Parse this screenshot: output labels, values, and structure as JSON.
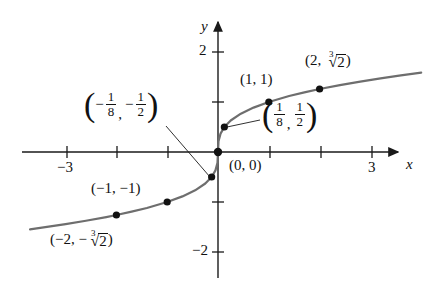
{
  "figure": {
    "title_visible": false,
    "background_color": "#ffffff",
    "curve_color": "#6e6e6e",
    "axis_color": "#1a1a1a",
    "point_color": "#111111"
  },
  "axes": {
    "x_axis_label": "x",
    "y_axis_label": "y",
    "x_ticks": [
      {
        "value": -3,
        "label": "−3",
        "show_label": true
      },
      {
        "value": -2,
        "label": "",
        "show_label": false
      },
      {
        "value": -1,
        "label": "",
        "show_label": false
      },
      {
        "value": 1,
        "label": "",
        "show_label": false
      },
      {
        "value": 2,
        "label": "",
        "show_label": false
      },
      {
        "value": 3,
        "label": "3",
        "show_label": true
      }
    ],
    "y_ticks": [
      {
        "value": 2,
        "label": "2",
        "show_label": true
      },
      {
        "value": 1,
        "label": "",
        "show_label": false
      },
      {
        "value": -1,
        "label": "",
        "show_label": false
      },
      {
        "value": -2,
        "label": "−2",
        "show_label": true
      }
    ],
    "xlim": [
      -3.9,
      4.15
    ],
    "ylim": [
      -2.55,
      2.35
    ],
    "grid": false
  },
  "chart_data": {
    "type": "line",
    "title": "",
    "xlabel": "x",
    "ylabel": "y",
    "xlim": [
      -3.9,
      4.15
    ],
    "ylim": [
      -2.55,
      2.35
    ],
    "grid": false,
    "legend": "none",
    "function": "y = cube root of x",
    "series": [
      {
        "name": "y = ∛x",
        "color": "#6e6e6e",
        "x": [
          -3.7,
          -3.4,
          -3.0,
          -2.6,
          -2.2,
          -2.0,
          -1.7,
          -1.4,
          -1.0,
          -0.7,
          -0.45,
          -0.25,
          -0.125,
          -0.05,
          -0.01,
          0,
          0.01,
          0.05,
          0.125,
          0.25,
          0.45,
          0.7,
          1.0,
          1.4,
          1.7,
          2.0,
          2.4,
          2.8,
          3.2,
          3.6,
          4.0
        ],
        "y": [
          -1.547,
          -1.504,
          -1.442,
          -1.375,
          -1.301,
          -1.26,
          -1.193,
          -1.119,
          -1.0,
          -0.888,
          -0.766,
          -0.63,
          -0.5,
          -0.368,
          -0.215,
          0,
          0.215,
          0.368,
          0.5,
          0.63,
          0.766,
          0.888,
          1.0,
          1.119,
          1.193,
          1.26,
          1.339,
          1.409,
          1.474,
          1.533,
          1.587
        ]
      }
    ],
    "points": [
      {
        "id": "p-neg2",
        "x": -2,
        "y": -1.26,
        "label_text": "(−2, −∛2)"
      },
      {
        "id": "p-neg1",
        "x": -1,
        "y": -1,
        "label_text": "(−1, −1)"
      },
      {
        "id": "p-neg-eighth",
        "x": -0.125,
        "y": -0.5,
        "label_text": "(−1/8, −1/2)"
      },
      {
        "id": "p-origin",
        "x": 0,
        "y": 0,
        "label_text": "(0, 0)"
      },
      {
        "id": "p-pos-eighth",
        "x": 0.125,
        "y": 0.5,
        "label_text": "(1/8, 1/2)"
      },
      {
        "id": "p-pos1",
        "x": 1,
        "y": 1,
        "label_text": "(1, 1)"
      },
      {
        "id": "p-pos2",
        "x": 2,
        "y": 1.26,
        "label_text": "(2, ∛2)"
      }
    ]
  },
  "labels": {
    "origin": "(0, 0)",
    "point_1_1": "(1, 1)",
    "point_neg1_neg1": "(−1, −1)",
    "point_2_cbrt2": {
      "open_paren": "(",
      "x_part": "2,",
      "radical_index": "3",
      "radical_glyph": "√",
      "radicand": "2",
      "close_paren": ")"
    },
    "point_neg2_neg_cbrt2": {
      "open_paren": "(",
      "x_part": "−2,",
      "minus": "−",
      "radical_index": "3",
      "radical_glyph": "√",
      "radicand": "2",
      "close_paren": ")"
    },
    "point_eighth_half": {
      "open_paren": "(",
      "x_num": "1",
      "x_den": "8",
      "comma": ",",
      "y_num": "1",
      "y_den": "2",
      "close_paren": ")"
    },
    "point_neg_eighth_neg_half": {
      "open_paren": "(",
      "x_sign": "−",
      "x_num": "1",
      "x_den": "8",
      "comma": ",",
      "y_sign": "−",
      "y_num": "1",
      "y_den": "2",
      "close_paren": ")"
    }
  }
}
